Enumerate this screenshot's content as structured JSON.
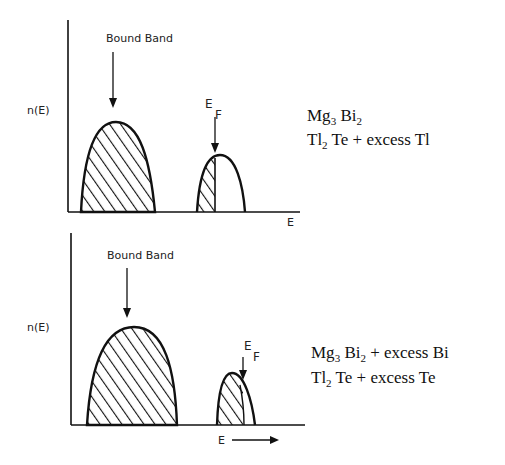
{
  "panels": [
    {
      "id": "top",
      "y_label": "n(E)",
      "x_label": "E",
      "band_label": "Bound Band",
      "fermi_label": {
        "main": "E",
        "sub": "F"
      },
      "composition": [
        {
          "parts": [
            {
              "t": "Mg"
            },
            {
              "t": "3",
              "sub": true
            },
            {
              "t": " Bi"
            },
            {
              "t": "2",
              "sub": true
            }
          ]
        },
        {
          "parts": [
            {
              "t": "Tl"
            },
            {
              "t": "2",
              "sub": true
            },
            {
              "t": " Te + excess Tl"
            }
          ]
        }
      ],
      "composition_text": [
        "Mg3 Bi2",
        "Tl2 Te + excess Tl"
      ],
      "description": "Bound band fully filled; Fermi level lies within the second (conduction) band, which is partially filled"
    },
    {
      "id": "bottom",
      "y_label": "n(E)",
      "x_label": "E",
      "x_arrow": true,
      "band_label": "Bound Band",
      "fermi_label": {
        "main": "E",
        "sub": "F"
      },
      "composition": [
        {
          "parts": [
            {
              "t": "Mg"
            },
            {
              "t": "3",
              "sub": true
            },
            {
              "t": " Bi"
            },
            {
              "t": "2",
              "sub": true
            },
            {
              "t": "  + excess Bi"
            }
          ]
        },
        {
          "parts": [
            {
              "t": "Tl"
            },
            {
              "t": "2",
              "sub": true
            },
            {
              "t": " Te + excess Te"
            }
          ]
        }
      ],
      "composition_text": [
        "Mg3 Bi2 + excess Bi",
        "Tl2 Te + excess Te"
      ],
      "description": "Bound band fully filled; Fermi level near top of second band, which is almost fully filled"
    }
  ],
  "colors": {
    "ink": "#111111",
    "background": "#ffffff"
  }
}
